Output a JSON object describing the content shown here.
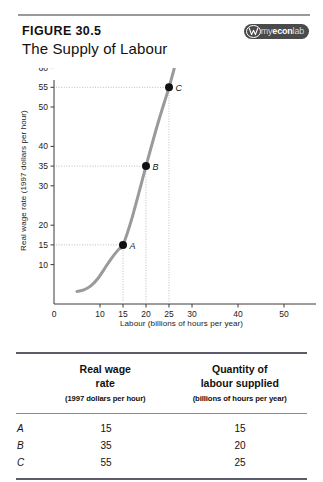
{
  "header": {
    "figure_label": "FIGURE 30.5",
    "title": "The Supply of Labour",
    "badge": {
      "mark_icon": "myeconlab-w-mark-icon",
      "text_my": "my",
      "text_econ": "econ",
      "text_lab": "lab"
    }
  },
  "chart_data": {
    "type": "line",
    "title": "The Supply of Labour",
    "xlabel": "Labour (billions of hours per year)",
    "ylabel": "Real wage rate (1997 dollars per hour)",
    "xlim": [
      0,
      55
    ],
    "ylim": [
      0,
      62
    ],
    "grid": "dotted-guides-only",
    "legend": "none",
    "curve_label": "LS",
    "curve_name": "Labour supply curve",
    "curve_color": "#9a9a9a",
    "x_ticks": [
      0,
      10,
      15,
      20,
      25,
      30,
      40,
      50
    ],
    "x_tick_labels": [
      "0",
      "10",
      "15",
      "20",
      "25",
      "30",
      "40",
      "50"
    ],
    "y_ticks": [
      10,
      15,
      20,
      30,
      35,
      40,
      50,
      55,
      60
    ],
    "y_tick_labels": [
      "10",
      "15",
      "20",
      "30",
      "35",
      "40",
      "50",
      "55",
      "60"
    ],
    "series": [
      {
        "name": "LS",
        "x": [
          5.0,
          6.5,
          8.0,
          9.5,
          11.0,
          12.5,
          14.0,
          15.0,
          17.0,
          20.0,
          22.5,
          25.0,
          26.3
        ],
        "y": [
          3.2,
          3.6,
          4.6,
          6.4,
          9.0,
          11.6,
          13.8,
          15.0,
          22.0,
          35.0,
          45.5,
          55.0,
          60.5
        ]
      }
    ],
    "points": [
      {
        "label": "A",
        "x": 15,
        "y": 15
      },
      {
        "label": "B",
        "x": 20,
        "y": 35
      },
      {
        "label": "C",
        "x": 25,
        "y": 55
      }
    ]
  },
  "table": {
    "columns": [
      {
        "title_line1": "Real wage",
        "title_line2": "rate",
        "subtitle": "(1997 dollars per hour)"
      },
      {
        "title_line1": "Quantity of",
        "title_line2": "labour supplied",
        "subtitle": "(billions of hours per year)"
      }
    ],
    "rows": [
      {
        "key": "A",
        "real_wage_rate": "15",
        "quantity_supplied": "15"
      },
      {
        "key": "B",
        "real_wage_rate": "35",
        "quantity_supplied": "20"
      },
      {
        "key": "C",
        "real_wage_rate": "55",
        "quantity_supplied": "25"
      }
    ]
  }
}
